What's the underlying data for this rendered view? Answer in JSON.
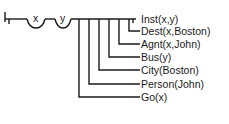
{
  "diagram": {
    "variables": [
      "x",
      "y"
    ],
    "predicates": [
      {
        "label": "Inst(x,y)",
        "y": 19
      },
      {
        "label": "Dest(x,Boston)",
        "y": 31
      },
      {
        "label": "Agnt(x,John)",
        "y": 44
      },
      {
        "label": "Bus(y)",
        "y": 57
      },
      {
        "label": "City(Boston)",
        "y": 70
      },
      {
        "label": "Person(John)",
        "y": 84
      },
      {
        "label": "Go(x)",
        "y": 97
      }
    ],
    "colors": {
      "line": "#1a1a1a",
      "background": "#ffffff"
    }
  }
}
